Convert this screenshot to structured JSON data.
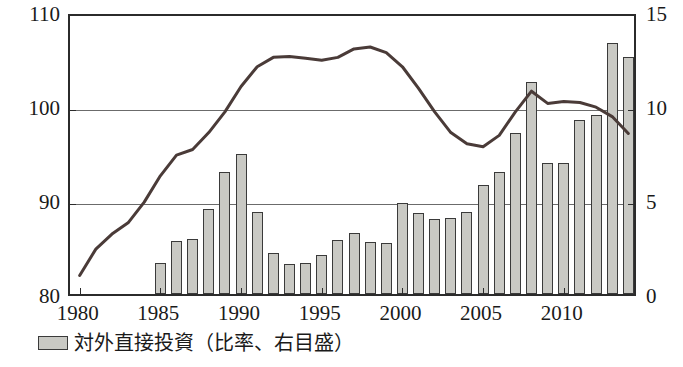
{
  "chart_data": {
    "type": "bar",
    "title": "",
    "subtitle": "",
    "xlabel": "",
    "ylabel": "",
    "y_left": {
      "label": "",
      "lim": [
        80,
        110
      ],
      "ticks": [
        80,
        90,
        100,
        110
      ],
      "tick_labels": [
        "80",
        "90",
        "100",
        "110"
      ]
    },
    "y_right": {
      "label": "",
      "lim": [
        0,
        15
      ],
      "ticks": [
        0,
        5,
        10,
        15
      ],
      "tick_labels": [
        "0",
        "5",
        "10",
        "15"
      ]
    },
    "x": [
      1980,
      1981,
      1982,
      1983,
      1984,
      1985,
      1986,
      1987,
      1988,
      1989,
      1990,
      1991,
      1992,
      1993,
      1994,
      1995,
      1996,
      1997,
      1998,
      1999,
      2000,
      2001,
      2002,
      2003,
      2004,
      2005,
      2006,
      2007,
      2008,
      2009,
      2010,
      2011,
      2012,
      2013,
      2014
    ],
    "xtick_labels": [
      "1980",
      "1985",
      "1990",
      "1995",
      "2000",
      "2005",
      "2010"
    ],
    "xticks": [
      1980,
      1985,
      1990,
      1995,
      2000,
      2005,
      2010
    ],
    "grid": "horizontal",
    "legend_position": "below-left",
    "series": [
      {
        "name": "対外直接投資（比率、右目盛）",
        "type": "bar",
        "axis": "right",
        "color": "#c9c9c4",
        "values": [
          null,
          null,
          null,
          null,
          null,
          1.65,
          2.8,
          2.95,
          4.5,
          6.5,
          7.45,
          4.35,
          2.2,
          1.6,
          1.65,
          2.1,
          2.85,
          3.25,
          2.75,
          2.7,
          4.85,
          4.3,
          4.0,
          4.05,
          4.35,
          5.8,
          6.5,
          8.55,
          11.3,
          6.95,
          6.95,
          9.25,
          9.5,
          13.35,
          12.6
        ]
      },
      {
        "name": "line-series",
        "type": "line",
        "axis": "left",
        "color": "#4a3b38",
        "values": [
          82.4,
          85.2,
          86.8,
          88.0,
          90.2,
          93.0,
          95.2,
          95.8,
          97.6,
          99.8,
          102.5,
          104.6,
          105.6,
          105.7,
          105.5,
          105.3,
          105.6,
          106.5,
          106.7,
          106.1,
          104.6,
          102.3,
          99.8,
          97.6,
          96.4,
          96.1,
          97.3,
          99.8,
          102.0,
          100.7,
          100.9,
          100.8,
          100.3,
          99.3,
          97.5
        ]
      }
    ]
  },
  "legend": {
    "swatch_name": "legend-swatch-bar",
    "label": "対外直接投資（比率、右目盛）"
  }
}
